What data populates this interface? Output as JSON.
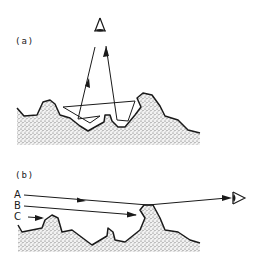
{
  "figure": {
    "panels": [
      {
        "label": "(a)",
        "description": "Viewer looking down at rough surface; ray descends, undergoes multiple reflections in surface cavities, and returns upward to the eye"
      },
      {
        "label": "(b)",
        "description": "Viewer at grazing angle; rays A, B, C travel nearly parallel to rough surface; only ray A reaches the eye, B and C are blocked by surface peaks"
      }
    ],
    "rays": {
      "A": "A",
      "B": "B",
      "C": "C"
    },
    "icons": {
      "eye_a": "eye-icon",
      "eye_b": "eye-icon"
    },
    "colors": {
      "line": "#1a1a1a",
      "stipple": "#555555",
      "background": "#ffffff"
    }
  }
}
